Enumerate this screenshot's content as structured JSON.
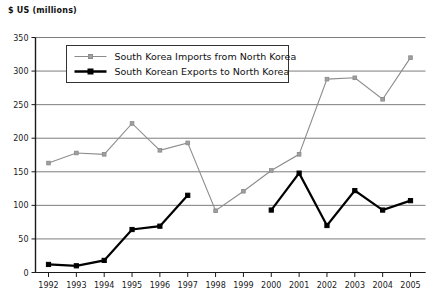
{
  "chart_data": {
    "type": "line",
    "title": "",
    "ylabel": "$ US (millions)",
    "xlabel": "",
    "grid": true,
    "legend_position": "top-center-inside",
    "ylim": [
      0,
      350
    ],
    "ytick_step": 50,
    "ytick_labels": [
      "0",
      "50",
      "100",
      "150",
      "200",
      "250",
      "300",
      "350"
    ],
    "categories": [
      "1992",
      "1993",
      "1994",
      "1995",
      "1996",
      "1997",
      "1998",
      "1999",
      "2000",
      "2001",
      "2002",
      "2003",
      "2004",
      "2005"
    ],
    "series": [
      {
        "name": "South Korea Imports from North Korea",
        "color": "#8c8c8c",
        "marker": "square",
        "values": [
          163,
          178,
          176,
          222,
          182,
          193,
          92,
          121,
          152,
          176,
          288,
          290,
          258,
          320
        ]
      },
      {
        "name": "South Korean Exports to North Korea",
        "color": "#000000",
        "marker": "square-filled",
        "values": [
          12,
          10,
          18,
          64,
          69,
          115,
          null,
          null,
          93,
          148,
          70,
          122,
          93,
          107
        ]
      }
    ]
  },
  "legend": {
    "entries": [
      "South Korea Imports from North Korea",
      "South Korean Exports to North Korea"
    ]
  },
  "axis": {
    "y_axis_title": "$ US (millions)"
  }
}
